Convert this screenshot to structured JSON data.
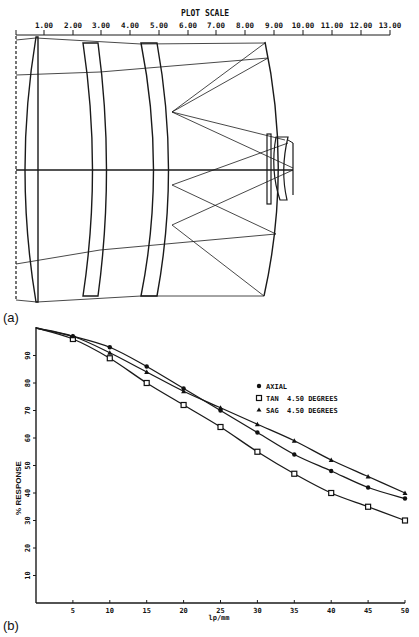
{
  "panel_a": {
    "label": "(a)",
    "scale_title": "PLOT SCALE",
    "scale_ticks": [
      "1.00",
      "2.00",
      "3.00",
      "4.00",
      "5.00",
      "6.00",
      "7.00",
      "8.00",
      "9.00",
      "10.00",
      "11.00",
      "12.00",
      "13.00"
    ]
  },
  "panel_b": {
    "label": "(b)"
  },
  "chart_data": {
    "type": "line",
    "title": "",
    "xlabel": "lp/mm",
    "ylabel": "% RESPONSE",
    "xlim": [
      0,
      50
    ],
    "ylim": [
      0,
      100
    ],
    "x_ticks": [
      5,
      10,
      15,
      20,
      25,
      30,
      35,
      40,
      45,
      50
    ],
    "y_ticks": [
      10,
      20,
      30,
      40,
      50,
      60,
      70,
      80,
      90
    ],
    "grid": false,
    "legend_position": "upper right (inside)",
    "x": [
      0,
      5,
      10,
      15,
      20,
      25,
      30,
      35,
      40,
      45,
      50
    ],
    "series": [
      {
        "name": "AXIAL",
        "marker": "filled-circle",
        "values": [
          100,
          97,
          93,
          86,
          78,
          70,
          62,
          54,
          48,
          42,
          38
        ]
      },
      {
        "name": "TAN  4.50 DEGREES",
        "marker": "square",
        "values": [
          100,
          96,
          89,
          80,
          72,
          64,
          55,
          47,
          40,
          35,
          30
        ]
      },
      {
        "name": "SAG  4.50 DEGREES",
        "marker": "triangle",
        "values": [
          100,
          97,
          91,
          84,
          77,
          71,
          65,
          59,
          52,
          46,
          40
        ]
      }
    ]
  }
}
